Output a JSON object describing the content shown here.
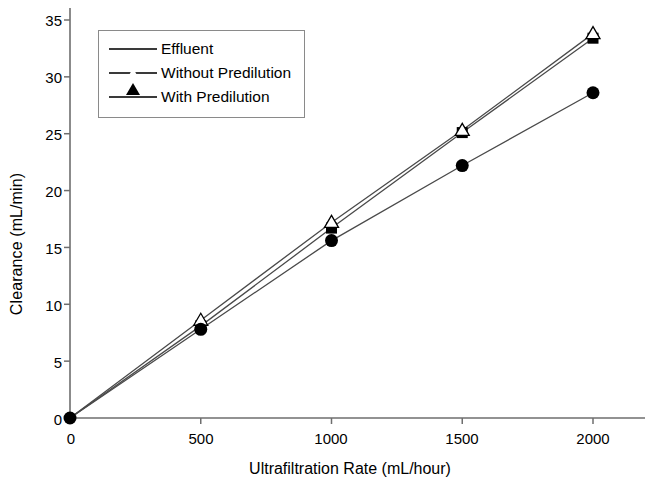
{
  "chart_data": {
    "type": "line",
    "title": "",
    "xlabel": "Ultrafiltration Rate (mL/hour)",
    "ylabel": "Clearance (mL/min)",
    "x": [
      0,
      500,
      1000,
      1500,
      2000
    ],
    "xlim": [
      0,
      2150
    ],
    "ylim": [
      0,
      36.5
    ],
    "xticks": [
      0,
      500,
      1000,
      1500,
      2000
    ],
    "xtick_labels": [
      "0",
      "500",
      "1000",
      "1500",
      "2000"
    ],
    "yticks": [
      0,
      5,
      10,
      15,
      20,
      25,
      30,
      35
    ],
    "ytick_labels": [
      "0",
      "5",
      "10",
      "15",
      "20",
      "25",
      "30",
      "35"
    ],
    "grid": false,
    "legend_position": "upper-left-inset",
    "series": [
      {
        "name": "Effluent",
        "marker": "filled-square",
        "color": "#000000",
        "values": [
          0,
          8.1,
          16.7,
          25.1,
          33.4
        ]
      },
      {
        "name": "Without Predilution",
        "marker": "open-triangle",
        "color": "#000000",
        "values": [
          0,
          8.6,
          17.2,
          25.3,
          33.8
        ]
      },
      {
        "name": "With Predilution",
        "marker": "filled-circle",
        "color": "#000000",
        "values": [
          0,
          7.8,
          15.6,
          22.2,
          28.6
        ]
      }
    ]
  },
  "legend": {
    "entries": [
      {
        "label": "Effluent"
      },
      {
        "label": "Without Predilution"
      },
      {
        "label": "With Predilution"
      }
    ]
  },
  "axes": {
    "y_title": "Clearance (mL/min)",
    "x_title": "Ultrafiltration Rate (mL/hour)",
    "y_labels": [
      "35",
      "30",
      "25",
      "20",
      "15",
      "10",
      "5",
      "0"
    ],
    "x_labels": [
      "0",
      "500",
      "1000",
      "1500",
      "2000"
    ]
  }
}
